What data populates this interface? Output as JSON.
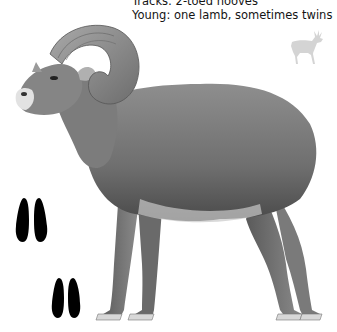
{
  "species_info": {
    "tracks_line": "Tracks: 2-toed hooves",
    "young_line": "Young: one lamb, sometimes twins"
  },
  "icons": {
    "size_comparison": "deer-silhouette-icon",
    "tracks": "hoof-track-icon"
  },
  "illustration": {
    "subject": "bighorn sheep ram",
    "style": "grayscale pencil drawing"
  },
  "colors": {
    "text": "#141414",
    "silhouette": "#d4d4d4",
    "track": "#000000",
    "background": "#ffffff"
  }
}
